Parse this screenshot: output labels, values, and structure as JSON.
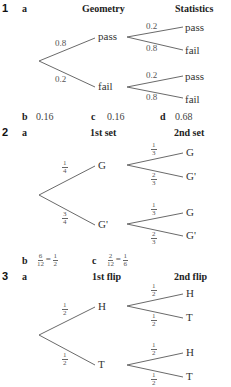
{
  "questions": [
    {
      "number": "1",
      "part_a": "a",
      "headers": [
        "Geometry",
        "Statistics"
      ],
      "tree": {
        "first": [
          {
            "label": "pass",
            "prob": "0.8",
            "second": [
              {
                "label": "pass",
                "prob": "0.2"
              },
              {
                "label": "fail",
                "prob": "0.8"
              }
            ]
          },
          {
            "label": "fail",
            "prob": "0.2",
            "second": [
              {
                "label": "pass",
                "prob": "0.2"
              },
              {
                "label": "fail",
                "prob": "0.8"
              }
            ]
          }
        ]
      },
      "answers": [
        {
          "part": "b",
          "value": "0.16"
        },
        {
          "part": "c",
          "value": "0.16"
        },
        {
          "part": "d",
          "value": "0.68"
        }
      ]
    },
    {
      "number": "2",
      "part_a": "a",
      "headers": [
        "1st set",
        "2nd set"
      ],
      "tree": {
        "first": [
          {
            "label": "G",
            "prob": {
              "num": "1",
              "den": "4"
            },
            "second": [
              {
                "label": "G",
                "prob": {
                  "num": "1",
                  "den": "3"
                }
              },
              {
                "label": "G'",
                "prob": {
                  "num": "2",
                  "den": "3"
                }
              }
            ]
          },
          {
            "label": "G'",
            "prob": {
              "num": "3",
              "den": "4"
            },
            "second": [
              {
                "label": "G",
                "prob": {
                  "num": "1",
                  "den": "3"
                }
              },
              {
                "label": "G'",
                "prob": {
                  "num": "2",
                  "den": "3"
                }
              }
            ]
          }
        ]
      },
      "answers": [
        {
          "part": "b",
          "lhs": {
            "num": "6",
            "den": "12"
          },
          "rhs": {
            "num": "1",
            "den": "2"
          }
        },
        {
          "part": "c",
          "lhs": {
            "num": "2",
            "den": "12"
          },
          "rhs": {
            "num": "1",
            "den": "6"
          }
        }
      ]
    },
    {
      "number": "3",
      "part_a": "a",
      "headers": [
        "1st flip",
        "2nd flip"
      ],
      "tree": {
        "first": [
          {
            "label": "H",
            "prob": {
              "num": "1",
              "den": "2"
            },
            "second": [
              {
                "label": "H",
                "prob": {
                  "num": "1",
                  "den": "2"
                }
              },
              {
                "label": "T",
                "prob": {
                  "num": "1",
                  "den": "2"
                }
              }
            ]
          },
          {
            "label": "T",
            "prob": {
              "num": "1",
              "den": "2"
            },
            "second": [
              {
                "label": "H",
                "prob": {
                  "num": "1",
                  "den": "2"
                }
              },
              {
                "label": "T",
                "prob": {
                  "num": "1",
                  "den": "2"
                }
              }
            ]
          }
        ]
      }
    }
  ]
}
